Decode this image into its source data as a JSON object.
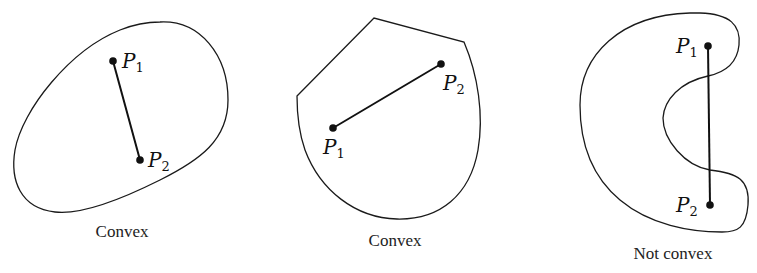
{
  "figures": [
    {
      "caption": "Convex",
      "p1": {
        "label": "P",
        "sub": "1"
      },
      "p2": {
        "label": "P",
        "sub": "2"
      }
    },
    {
      "caption": "Convex",
      "p1": {
        "label": "P",
        "sub": "1"
      },
      "p2": {
        "label": "P",
        "sub": "2"
      }
    },
    {
      "caption": "Not convex",
      "p1": {
        "label": "P",
        "sub": "1"
      },
      "p2": {
        "label": "P",
        "sub": "2"
      }
    }
  ]
}
